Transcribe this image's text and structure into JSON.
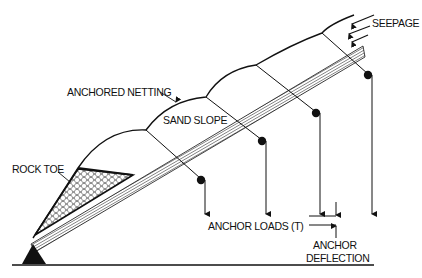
{
  "diagram": {
    "labels": {
      "seepage": "SEEPAGE",
      "anchored_netting": "ANCHORED NETTING",
      "sand_slope": "SAND SLOPE",
      "rock_toe": "ROCK TOE",
      "anchor_loads": "ANCHOR LOADS (T)",
      "anchor_deflection_line1": "ANCHOR",
      "anchor_deflection_line2": "DEFLECTION"
    },
    "colors": {
      "ink": "#111111",
      "background": "#ffffff"
    },
    "anchor_count": 4,
    "seepage_arrow_count": 3
  }
}
